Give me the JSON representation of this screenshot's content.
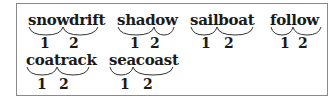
{
  "words": [
    {
      "word": "snowdrift",
      "part1": "snow",
      "part2": "drift",
      "label1": "1",
      "label2": "2"
    },
    {
      "word": "shadow",
      "part1": "shad",
      "part2": "ow",
      "label1": "1",
      "label2": "2"
    },
    {
      "word": "sailboat",
      "part1": "sail",
      "part2": "boat",
      "label1": "1",
      "label2": "2"
    },
    {
      "word": "follow",
      "part1": "fol",
      "part2": "low",
      "label1": "1",
      "label2": "2"
    },
    {
      "word": "coatrack",
      "part1": "coat",
      "part2": "rack",
      "label1": "1",
      "label2": "2"
    },
    {
      "word": "seacoast",
      "part1": "sea",
      "part2": "coast",
      "label1": "1",
      "label2": "2"
    }
  ]
}
